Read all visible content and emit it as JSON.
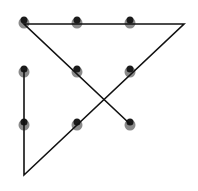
{
  "diagram": {
    "type": "nine-dots-puzzle-solution",
    "background": "#ffffff",
    "line_color": "#111111",
    "dot_top_color": "#1a1a1a",
    "dot_bottom_color": "#8a8a8a",
    "dots": [
      {
        "x": 24,
        "y": 22
      },
      {
        "x": 77,
        "y": 22
      },
      {
        "x": 130,
        "y": 22
      },
      {
        "x": 24,
        "y": 71
      },
      {
        "x": 77,
        "y": 71
      },
      {
        "x": 130,
        "y": 71
      },
      {
        "x": 24,
        "y": 124
      },
      {
        "x": 77,
        "y": 124
      },
      {
        "x": 130,
        "y": 124
      }
    ],
    "path": [
      {
        "x": 24,
        "y": 70
      },
      {
        "x": 24,
        "y": 175
      },
      {
        "x": 184,
        "y": 24
      },
      {
        "x": 24,
        "y": 24
      },
      {
        "x": 130,
        "y": 124
      }
    ]
  }
}
